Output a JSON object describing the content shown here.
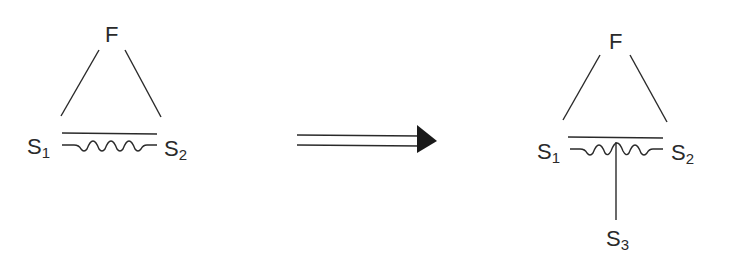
{
  "diagram": {
    "type": "transformation",
    "left": {
      "top_label": "F",
      "left_label": {
        "base": "S",
        "sub": "1"
      },
      "right_label": {
        "base": "S",
        "sub": "2"
      },
      "connections": [
        "F-S1 line",
        "F-S2 line",
        "S1-S2 straight bond",
        "S1-S2 wavy bond"
      ]
    },
    "arrow": {
      "style": "double-line arrow",
      "direction": "right"
    },
    "right": {
      "top_label": "F",
      "left_label": {
        "base": "S",
        "sub": "1"
      },
      "right_label": {
        "base": "S",
        "sub": "2"
      },
      "bottom_label": {
        "base": "S",
        "sub": "3"
      },
      "connections": [
        "F-S1 line",
        "F-S2 line",
        "S1-S2 straight bond",
        "S1-S2 wavy bond",
        "wavy bond midpoint - S3 line"
      ]
    }
  }
}
